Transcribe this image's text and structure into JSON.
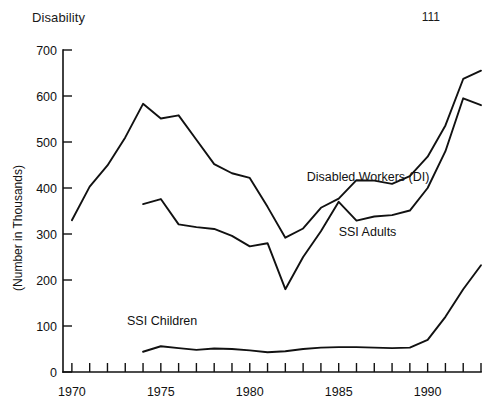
{
  "page": {
    "title": "Disability",
    "number": "111"
  },
  "chart_data": {
    "type": "line",
    "title": "Disability",
    "xlabel": "",
    "ylabel": "(Number in Thousands)",
    "xlim": [
      1969.5,
      1993.0
    ],
    "ylim": [
      0,
      700
    ],
    "grid": false,
    "legend_position": "inline-annotations",
    "ytick_labels": [
      "0",
      "100",
      "200",
      "300",
      "400",
      "500",
      "600",
      "700"
    ],
    "ytick_values": [
      0,
      100,
      200,
      300,
      400,
      500,
      600,
      700
    ],
    "xtick_labels": [
      "1970",
      "1975",
      "1980",
      "1985",
      "1990"
    ],
    "xtick_values": [
      1970,
      1975,
      1980,
      1985,
      1990
    ],
    "xtick_minor_values": [
      1970,
      1971,
      1972,
      1973,
      1974,
      1975,
      1976,
      1977,
      1978,
      1979,
      1980,
      1981,
      1982,
      1983,
      1984,
      1985,
      1986,
      1987,
      1988,
      1989,
      1990,
      1991,
      1992,
      1993
    ],
    "series": [
      {
        "name": "Disabled Workers (DI)",
        "label_x": 1983.2,
        "label_y": 415,
        "x": [
          1970,
          1971,
          1972,
          1973,
          1974,
          1975,
          1976,
          1977,
          1978,
          1979,
          1980,
          1981,
          1982,
          1983,
          1984,
          1985,
          1986,
          1987,
          1988,
          1989,
          1990,
          1991,
          1992,
          1993
        ],
        "values": [
          330,
          403,
          449,
          510,
          583,
          551,
          558,
          505,
          452,
          432,
          422,
          359,
          292,
          312,
          357,
          377,
          417,
          416,
          409,
          426,
          468,
          536,
          637,
          655
        ]
      },
      {
        "name": "SSI Adults",
        "label_x": 1985.0,
        "label_y": 296,
        "x": [
          1974,
          1975,
          1976,
          1977,
          1978,
          1979,
          1980,
          1981,
          1982,
          1983,
          1984,
          1985,
          1986,
          1987,
          1988,
          1989,
          1990,
          1991,
          1992,
          1993
        ],
        "values": [
          365,
          376,
          321,
          315,
          311,
          296,
          273,
          280,
          180,
          250,
          306,
          370,
          329,
          338,
          341,
          351,
          400,
          480,
          595,
          580
        ]
      },
      {
        "name": "SSI Children",
        "label_x": 1973.1,
        "label_y": 102,
        "x": [
          1974,
          1975,
          1976,
          1977,
          1978,
          1979,
          1980,
          1981,
          1982,
          1983,
          1984,
          1985,
          1986,
          1987,
          1988,
          1989,
          1990,
          1991,
          1992,
          1993
        ],
        "values": [
          44,
          56,
          52,
          48,
          51,
          50,
          47,
          43,
          45,
          50,
          53,
          54,
          54,
          53,
          52,
          53,
          70,
          120,
          180,
          232
        ]
      }
    ]
  },
  "colors": {
    "line": "#111111",
    "text": "#111111",
    "background": "#ffffff"
  }
}
